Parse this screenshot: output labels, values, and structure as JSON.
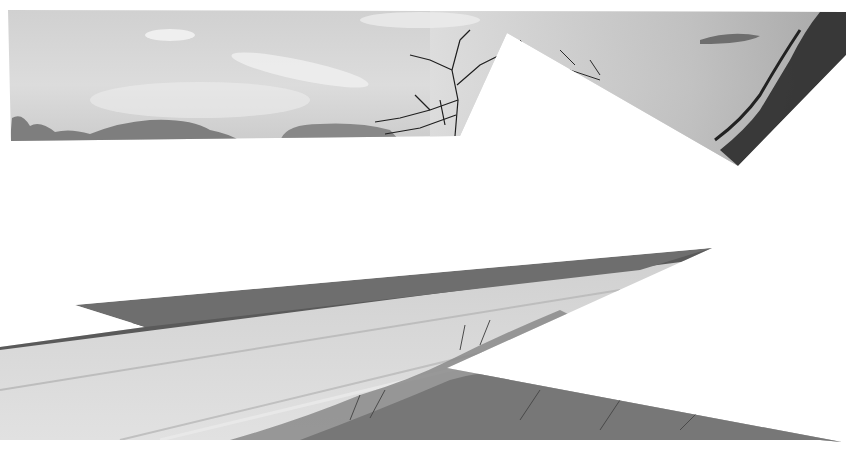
{
  "image": {
    "description": "Black and white photograph of a cloudy sky with bare trees above a dirt road with grassy verges, partially masked by large white polygonal shapes",
    "width": 866,
    "height": 461,
    "palette": {
      "background": "#ffffff",
      "sky_light": "#e6e6e6",
      "sky_mid": "#c8c8c8",
      "sky_dark": "#9a9a9a",
      "cloud_dark": "#7e7e7e",
      "tree": "#1e1e1e",
      "road_light": "#dedede",
      "road_mid": "#cfcfcf",
      "verge_dark": "#5a5a5a",
      "grass": "#6e6e6e"
    },
    "regions": {
      "sky": {
        "label": "sky-with-trees",
        "polygon": "8,10 846,12 846,55 738,166 507,33 460,136 11,141"
      },
      "road": {
        "label": "road-and-verge",
        "polygon": "0,347 145,327 75,305 712,248 447,368 842,442 820,440 0,440"
      }
    }
  }
}
